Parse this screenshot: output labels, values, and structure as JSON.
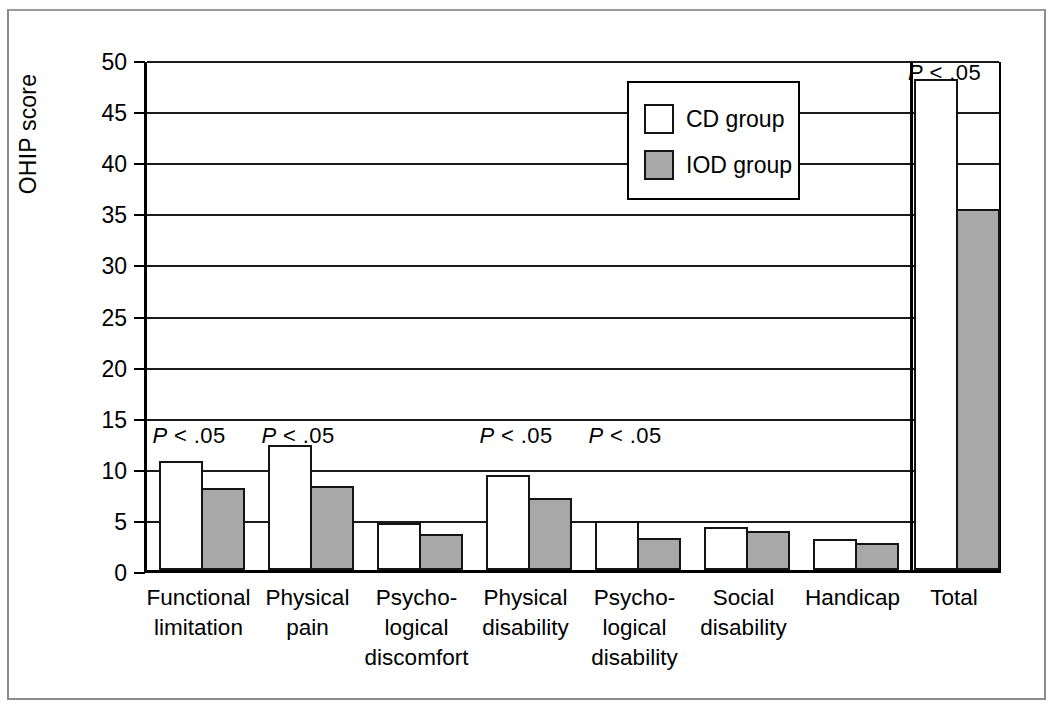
{
  "chart_data": {
    "type": "bar",
    "title": "",
    "xlabel": "",
    "ylabel": "OHIP score",
    "ylim": [
      0,
      50
    ],
    "ytick_labels": [
      "50",
      "45",
      "40",
      "35",
      "30",
      "25",
      "20",
      "15",
      "10",
      "5",
      "0"
    ],
    "yticks": [
      50,
      45,
      40,
      35,
      30,
      25,
      20,
      15,
      10,
      5,
      0
    ],
    "grid": true,
    "legend_position": "top-right-inside",
    "categories": [
      "Functional limitation",
      "Physical pain",
      "Psycho-logical discomfort",
      "Physical disability",
      "Psycho-logical disability",
      "Social disability",
      "Handicap",
      "Total"
    ],
    "category_lines": [
      [
        "Functional",
        "limitation"
      ],
      [
        "Physical",
        "pain"
      ],
      [
        "Psycho-",
        "logical",
        "discomfort"
      ],
      [
        "Physical",
        "disability"
      ],
      [
        "Psycho-",
        "logical",
        "disability"
      ],
      [
        "Social",
        "disability"
      ],
      [
        "Handicap"
      ],
      [
        "Total"
      ]
    ],
    "series": [
      {
        "name": "CD group",
        "color": "#ffffff",
        "values": [
          10.7,
          12.2,
          4.6,
          9.3,
          4.8,
          4.2,
          3.0,
          48.0
        ]
      },
      {
        "name": "IOD group",
        "color": "#a8a8a8",
        "values": [
          8.0,
          8.2,
          3.5,
          7.0,
          3.1,
          3.8,
          2.6,
          35.3
        ]
      }
    ],
    "annotations": [
      {
        "text": "P < .05",
        "category_index": 0
      },
      {
        "text": "P < .05",
        "category_index": 1
      },
      {
        "text": "P < .05",
        "category_index": 3
      },
      {
        "text": "P < .05",
        "category_index": 4
      },
      {
        "text": "P < .05",
        "category_index": 7
      }
    ],
    "annotation_parts": {
      "italic": "P",
      "rest": " < .05"
    }
  },
  "legend": {
    "items": [
      {
        "label": "CD group",
        "swatch": "white"
      },
      {
        "label": "IOD group",
        "swatch": "gray"
      }
    ]
  },
  "axis": {
    "y_title": "OHIP score"
  }
}
